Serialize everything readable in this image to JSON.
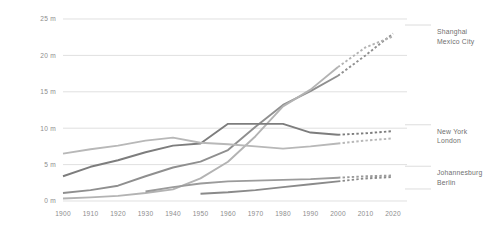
{
  "chart_data": {
    "type": "line",
    "title": "",
    "subtitle": "",
    "xlabel": "",
    "ylabel": "",
    "xlim": [
      1900,
      2020
    ],
    "ylim": [
      0,
      25
    ],
    "grid": true,
    "legend_position": "right",
    "x": [
      1900,
      1910,
      1920,
      1930,
      1940,
      1950,
      1960,
      1970,
      1980,
      1990,
      2000,
      2010,
      2020
    ],
    "xtick_labels": [
      "1900",
      "1910",
      "1920",
      "1930",
      "1940",
      "1950",
      "1960",
      "1970",
      "1980",
      "1990",
      "2000",
      "2010",
      "2020"
    ],
    "ytick_values": [
      0,
      5,
      10,
      15,
      20,
      25
    ],
    "ytick_labels": [
      "0 m",
      "5 m",
      "10 m",
      "15 m",
      "20 m",
      "25 m"
    ],
    "value_unit": "m",
    "projection_starts_at": 2000,
    "projection_style": "dashed",
    "series": [
      {
        "name": "Shanghai",
        "color": "#8f8f8f",
        "x": [
          1900,
          1910,
          1920,
          1930,
          1940,
          1950,
          1960,
          1970,
          1980,
          1990,
          2000,
          2010,
          2020
        ],
        "values": [
          1.1,
          1.5,
          2.1,
          3.4,
          4.6,
          5.4,
          7.0,
          10.2,
          13.2,
          15.1,
          17.2,
          20.0,
          23.0
        ],
        "solid_through": 2000
      },
      {
        "name": "Mexico City",
        "color": "#b3b3b3",
        "x": [
          1900,
          1910,
          1920,
          1930,
          1940,
          1950,
          1960,
          1970,
          1980,
          1990,
          2000,
          2010,
          2020
        ],
        "values": [
          0.35,
          0.5,
          0.7,
          1.1,
          1.6,
          3.1,
          5.4,
          8.9,
          13.0,
          15.3,
          18.4,
          21.1,
          22.6
        ],
        "solid_through": 2000
      },
      {
        "name": "New York",
        "color": "#7d7d7d",
        "x": [
          1900,
          1910,
          1920,
          1930,
          1940,
          1950,
          1960,
          1970,
          1980,
          1990,
          2000,
          2010,
          2020
        ],
        "values": [
          3.4,
          4.7,
          5.6,
          6.7,
          7.6,
          7.9,
          10.6,
          10.6,
          10.6,
          9.4,
          9.1,
          9.3,
          9.6
        ],
        "solid_through": 2000
      },
      {
        "name": "London",
        "color": "#b8b8b8",
        "x": [
          1900,
          1910,
          1920,
          1930,
          1940,
          1950,
          1960,
          1970,
          1980,
          1990,
          2000,
          2010,
          2020
        ],
        "values": [
          6.5,
          7.1,
          7.6,
          8.3,
          8.7,
          8.0,
          7.8,
          7.5,
          7.2,
          7.5,
          7.9,
          8.3,
          8.6
        ],
        "solid_through": 2000
      },
      {
        "name": "Johannesburg",
        "color": "#9b9b9b",
        "x": [
          1930,
          1940,
          1950,
          1960,
          1970,
          1980,
          1990,
          2000,
          2010,
          2020
        ],
        "values": [
          1.3,
          1.9,
          2.4,
          2.7,
          2.8,
          2.9,
          3.0,
          3.2,
          3.4,
          3.5
        ],
        "solid_through": 2000
      },
      {
        "name": "Berlin",
        "color": "#8a8a8a",
        "x": [
          1950,
          1960,
          1970,
          1980,
          1990,
          2000,
          2010,
          2020
        ],
        "values": [
          1.0,
          1.2,
          1.5,
          1.9,
          2.3,
          2.7,
          3.1,
          3.3
        ],
        "solid_through": 2000
      }
    ],
    "legend_groups": [
      {
        "labels": [
          "Shanghai",
          "Mexico City"
        ]
      },
      {
        "labels": [
          "New York",
          "London"
        ]
      },
      {
        "labels": [
          "Johannesburg",
          "Berlin"
        ]
      }
    ]
  }
}
